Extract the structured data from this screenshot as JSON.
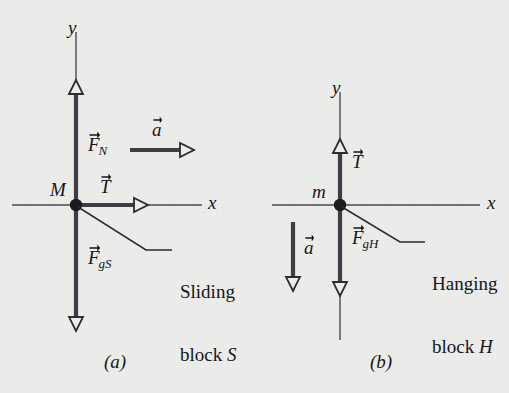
{
  "figure": {
    "background_color": "#ececeb",
    "ink_color": "#2b2b30",
    "axis_color": "#3a3a40",
    "panels": [
      {
        "id": "a",
        "caption": "(a)",
        "origin": {
          "x": 76,
          "y": 205
        },
        "mass_label": "M",
        "axis_x_label": "x",
        "axis_y_label": "y",
        "callout_line1": "Sliding",
        "callout_line2": "block ",
        "callout_line2_italic": "S",
        "vectors": [
          {
            "name": "normal-force",
            "symbol": "F",
            "subscript": "N",
            "direction": "up"
          },
          {
            "name": "tension-force",
            "symbol": "T",
            "subscript": "",
            "direction": "right"
          },
          {
            "name": "gravitational-force",
            "symbol": "F",
            "subscript": "gS",
            "direction": "down"
          },
          {
            "name": "acceleration",
            "symbol": "a",
            "subscript": "",
            "direction": "right"
          }
        ]
      },
      {
        "id": "b",
        "caption": "(b)",
        "origin": {
          "x": 340,
          "y": 205
        },
        "mass_label": "m",
        "axis_x_label": "x",
        "axis_y_label": "y",
        "callout_line1": "Hanging",
        "callout_line2": "block ",
        "callout_line2_italic": "H",
        "vectors": [
          {
            "name": "tension-force",
            "symbol": "T",
            "subscript": "",
            "direction": "up"
          },
          {
            "name": "gravitational-force",
            "symbol": "F",
            "subscript": "gH",
            "direction": "down"
          },
          {
            "name": "acceleration",
            "symbol": "a",
            "subscript": "",
            "direction": "down"
          }
        ]
      }
    ]
  },
  "labels": {
    "a_y_axis": "y",
    "a_x_axis": "x",
    "a_mass": "M",
    "a_FN_symbol": "F",
    "a_FN_sub": "N",
    "a_T_symbol": "T",
    "a_Fgs_symbol": "F",
    "a_Fgs_sub": "gS",
    "a_accel_symbol": "a",
    "a_callout_l1": "Sliding",
    "a_callout_l2a": "block ",
    "a_callout_l2b": "S",
    "a_caption": "(a)",
    "b_y_axis": "y",
    "b_x_axis": "x",
    "b_mass": "m",
    "b_T_symbol": "T",
    "b_FgH_symbol": "F",
    "b_FgH_sub": "gH",
    "b_accel_symbol": "a",
    "b_callout_l1": "Hanging",
    "b_callout_l2a": "block ",
    "b_callout_l2b": "H",
    "b_caption": "(b)"
  }
}
